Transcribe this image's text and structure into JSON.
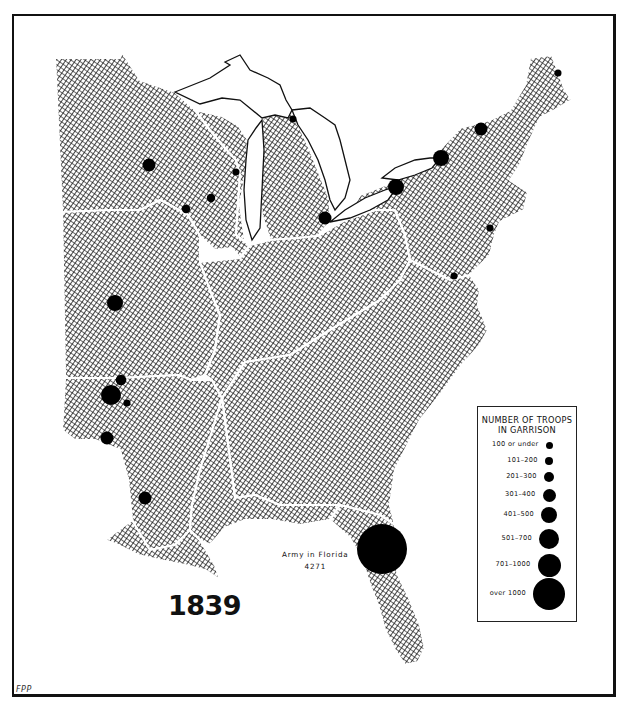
{
  "map": {
    "year": "1839",
    "credit": "FPP",
    "annotation": {
      "label": "Army in Florida",
      "value": "4271"
    },
    "colors": {
      "land_hatch": "#000000",
      "boundary": "#ffffff",
      "garrison": "#000000",
      "background": "#ffffff"
    }
  },
  "legend": {
    "title_line1": "NUMBER OF TROOPS",
    "title_line2": "IN GARRISON",
    "classes": [
      {
        "label": "100 or under",
        "min": 0,
        "max": 100
      },
      {
        "label": "101–200",
        "min": 101,
        "max": 200
      },
      {
        "label": "201–300",
        "min": 201,
        "max": 300
      },
      {
        "label": "301–400",
        "min": 301,
        "max": 400
      },
      {
        "label": "401–500",
        "min": 401,
        "max": 500
      },
      {
        "label": "501–700",
        "min": 501,
        "max": 700
      },
      {
        "label": "701–1000",
        "min": 701,
        "max": 1000
      },
      {
        "label": "over 1000",
        "min": 1001,
        "max": null
      }
    ]
  },
  "garrisons": [
    {
      "region": "Maine (north)",
      "class": 1
    },
    {
      "region": "northern New York (Plattsburgh)",
      "class": 4
    },
    {
      "region": "New York, Lake Ontario (Sackets Harbor)",
      "class": 5
    },
    {
      "region": "New York, Niagara (Buffalo)",
      "class": 5
    },
    {
      "region": "Michigan (Detroit)",
      "class": 4
    },
    {
      "region": "Mackinac straits",
      "class": 1
    },
    {
      "region": "Green Bay, Wisconsin",
      "class": 1
    },
    {
      "region": "Wisconsin interior (Fort Winnebago)",
      "class": 2
    },
    {
      "region": "Prairie du Chien",
      "class": 2
    },
    {
      "region": "Fort Snelling, Minnesota",
      "class": 4
    },
    {
      "region": "New York Harbor",
      "class": 1
    },
    {
      "region": "Washington / Virginia",
      "class": 1
    },
    {
      "region": "Fort Leavenworth",
      "class": 5
    },
    {
      "region": "Fort Gibson (upper)",
      "class": 3
    },
    {
      "region": "Fort Gibson",
      "class": 6
    },
    {
      "region": "Fort Smith",
      "class": 1
    },
    {
      "region": "Fort Towson",
      "class": 4
    },
    {
      "region": "Fort Jesup, Louisiana",
      "class": 4
    },
    {
      "region": "Army in Florida",
      "class": 8,
      "troops": 4271
    }
  ]
}
